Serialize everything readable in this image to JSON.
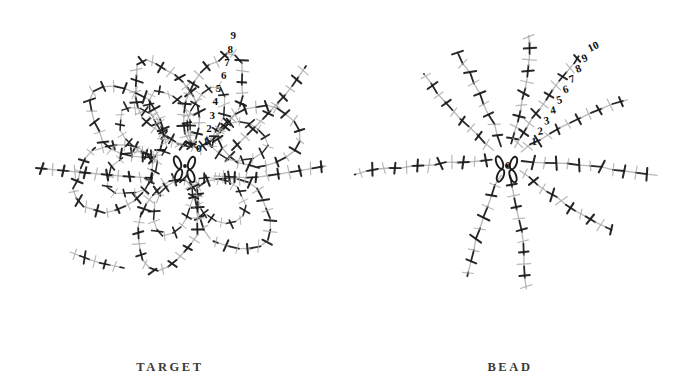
{
  "figure": {
    "background_color": "#ffffff",
    "ink_dark": "#1b1b1b",
    "ink_light": "#a8a8a8",
    "panel_count": 2
  },
  "panels": [
    {
      "id": "target",
      "caption": "TARGET",
      "description": "folded looped scaffold structure",
      "helix_labels": [
        "1",
        "2",
        "3",
        "4",
        "5",
        "6",
        "7",
        "8",
        "9"
      ],
      "label_origin": "0",
      "center_rings": 4,
      "center_dot": true
    },
    {
      "id": "bead",
      "caption": "BEAD",
      "description": "radial star structure with eight straight arms",
      "helix_labels": [
        "1",
        "2",
        "3",
        "4",
        "5",
        "6",
        "7",
        "8",
        "9",
        "10"
      ],
      "label_origin": "0",
      "center_rings": 4,
      "center_dot": true,
      "arm_count": 8
    }
  ],
  "chart_data": {
    "type": "diagram",
    "title": "",
    "panels": [
      {
        "name": "TARGET",
        "topology": "folded",
        "annotated_helices": [
          1,
          2,
          3,
          4,
          5,
          6,
          7,
          8,
          9
        ],
        "lobes": 6
      },
      {
        "name": "BEAD",
        "topology": "radial-star",
        "annotated_helices": [
          1,
          2,
          3,
          4,
          5,
          6,
          7,
          8,
          9,
          10
        ],
        "arms": 8
      }
    ]
  }
}
